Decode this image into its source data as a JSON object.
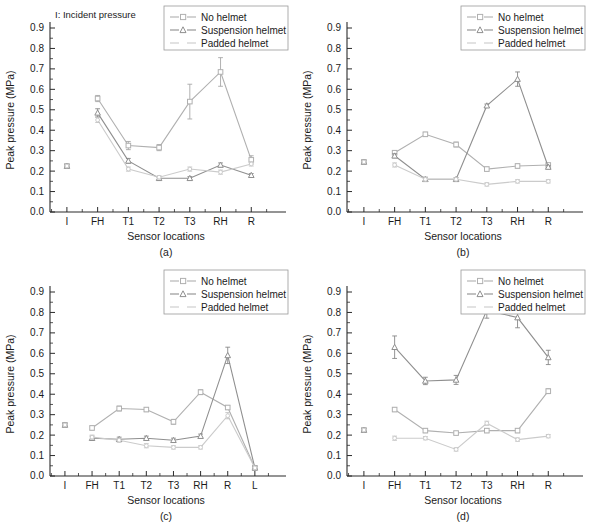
{
  "figure": {
    "axis_titles": {
      "x": "Sensor locations",
      "y": "Peak pressure (MPa)"
    },
    "note": "I: Incident pressure",
    "legend": {
      "entries": [
        {
          "label": "No helmet",
          "marker": "square",
          "color": "#b9b9b9"
        },
        {
          "label": "Suspension helmet",
          "marker": "triangle",
          "color": "#9c9c9c"
        },
        {
          "label": "Padded helmet",
          "marker": "none",
          "color": "#cfcfcf"
        }
      ]
    },
    "panels": [
      {
        "id": "a",
        "letter": "(a)"
      },
      {
        "id": "b",
        "letter": "(b)"
      },
      {
        "id": "c",
        "letter": "(c)"
      },
      {
        "id": "d",
        "letter": "(d)"
      }
    ]
  },
  "chart_data": [
    {
      "type": "line",
      "panel": "(a)",
      "title": "I: Incident pressure",
      "xlabel": "Sensor locations",
      "ylabel": "Peak pressure (MPa)",
      "categories": [
        "I",
        "FH",
        "T1",
        "T2",
        "T3",
        "RH",
        "R"
      ],
      "ylim": [
        0.0,
        0.9
      ],
      "yticks": [
        0.0,
        0.1,
        0.2,
        0.3,
        0.4,
        0.5,
        0.6,
        0.7,
        0.8,
        0.9
      ],
      "grid": false,
      "legend_position": "top-right",
      "series": [
        {
          "name": "No helmet",
          "marker": "square",
          "values": [
            0.225,
            0.555,
            0.325,
            0.315,
            0.54,
            0.685,
            0.255
          ],
          "errors": [
            0.008,
            0.015,
            0.02,
            0.015,
            0.085,
            0.07,
            0.02
          ]
        },
        {
          "name": "Suspension helmet",
          "marker": "triangle",
          "values": [
            0.225,
            0.485,
            0.25,
            0.165,
            0.165,
            0.23,
            0.18
          ],
          "errors": [
            0.008,
            0.02,
            0.012,
            0.008,
            0.008,
            0.01,
            0.008
          ]
        },
        {
          "name": "Padded helmet",
          "marker": "none",
          "values": [
            0.225,
            0.45,
            0.21,
            0.17,
            0.21,
            0.195,
            0.235
          ],
          "errors": [
            0.008,
            0.012,
            0.01,
            0.008,
            0.01,
            0.01,
            0.01
          ]
        }
      ]
    },
    {
      "type": "line",
      "panel": "(b)",
      "title": "",
      "xlabel": "Sensor locations",
      "ylabel": "Peak pressure (MPa)",
      "categories": [
        "I",
        "FH",
        "T1",
        "T2",
        "T3",
        "RH",
        "R"
      ],
      "ylim": [
        0.0,
        0.9
      ],
      "yticks": [
        0.0,
        0.1,
        0.2,
        0.3,
        0.4,
        0.5,
        0.6,
        0.7,
        0.8,
        0.9
      ],
      "grid": false,
      "legend_position": "top-right",
      "series": [
        {
          "name": "No helmet",
          "marker": "square",
          "values": [
            0.245,
            0.29,
            0.38,
            0.33,
            0.21,
            0.225,
            0.23
          ],
          "errors": [
            0.008,
            0.01,
            0.01,
            0.012,
            0.01,
            0.01,
            0.008
          ]
        },
        {
          "name": "Suspension helmet",
          "marker": "triangle",
          "values": [
            0.245,
            0.275,
            0.16,
            0.16,
            0.52,
            0.65,
            0.22
          ],
          "errors": [
            0.008,
            0.01,
            0.01,
            0.008,
            0.008,
            0.035,
            0.008
          ]
        },
        {
          "name": "Padded helmet",
          "marker": "none",
          "values": [
            0.245,
            0.23,
            0.16,
            0.16,
            0.135,
            0.15,
            0.15
          ],
          "errors": [
            0.008,
            0.01,
            0.01,
            0.008,
            0.008,
            0.008,
            0.008
          ]
        }
      ]
    },
    {
      "type": "line",
      "panel": "(c)",
      "title": "",
      "xlabel": "Sensor locations",
      "ylabel": "Peak pressure (MPa)",
      "categories": [
        "I",
        "FH",
        "T1",
        "T2",
        "T3",
        "RH",
        "R",
        "L"
      ],
      "ylim": [
        0.0,
        0.9
      ],
      "yticks": [
        0.0,
        0.1,
        0.2,
        0.3,
        0.4,
        0.5,
        0.6,
        0.7,
        0.8,
        0.9
      ],
      "grid": false,
      "legend_position": "top-right",
      "series": [
        {
          "name": "No helmet",
          "marker": "square",
          "values": [
            0.25,
            0.235,
            0.33,
            0.325,
            0.265,
            0.41,
            0.335,
            0.04
          ],
          "errors": [
            0.008,
            0.01,
            0.012,
            0.01,
            0.012,
            0.012,
            0.01,
            0.008
          ]
        },
        {
          "name": "Suspension helmet",
          "marker": "triangle",
          "values": [
            0.25,
            0.185,
            0.18,
            0.185,
            0.175,
            0.195,
            0.59,
            0.04
          ],
          "errors": [
            0.008,
            0.01,
            0.01,
            0.01,
            0.01,
            0.01,
            0.04,
            0.008
          ]
        },
        {
          "name": "Padded helmet",
          "marker": "none",
          "values": [
            0.25,
            0.19,
            0.175,
            0.148,
            0.14,
            0.14,
            0.295,
            0.04
          ],
          "errors": [
            0.008,
            0.01,
            0.01,
            0.01,
            0.008,
            0.008,
            0.015,
            0.008
          ]
        }
      ]
    },
    {
      "type": "line",
      "panel": "(d)",
      "title": "",
      "xlabel": "Sensor locations",
      "ylabel": "Peak pressure (MPa)",
      "categories": [
        "I",
        "FH",
        "T1",
        "T2",
        "T3",
        "RH",
        "R"
      ],
      "ylim": [
        0.0,
        0.9
      ],
      "yticks": [
        0.0,
        0.1,
        0.2,
        0.3,
        0.4,
        0.5,
        0.6,
        0.7,
        0.8,
        0.9
      ],
      "grid": false,
      "legend_position": "top-right",
      "series": [
        {
          "name": "No helmet",
          "marker": "square",
          "values": [
            0.225,
            0.325,
            0.222,
            0.21,
            0.222,
            0.222,
            0.415
          ],
          "errors": [
            0.008,
            0.01,
            0.01,
            0.008,
            0.01,
            0.01,
            0.012
          ]
        },
        {
          "name": "Suspension helmet",
          "marker": "triangle",
          "values": [
            0.225,
            0.63,
            0.465,
            0.47,
            0.81,
            0.775,
            0.58
          ],
          "errors": [
            0.008,
            0.055,
            0.018,
            0.022,
            0.038,
            0.05,
            0.035
          ]
        },
        {
          "name": "Padded helmet",
          "marker": "none",
          "values": [
            0.225,
            0.185,
            0.185,
            0.13,
            0.258,
            0.178,
            0.195
          ],
          "errors": [
            0.008,
            0.01,
            0.008,
            0.008,
            0.01,
            0.008,
            0.008
          ]
        }
      ]
    }
  ]
}
